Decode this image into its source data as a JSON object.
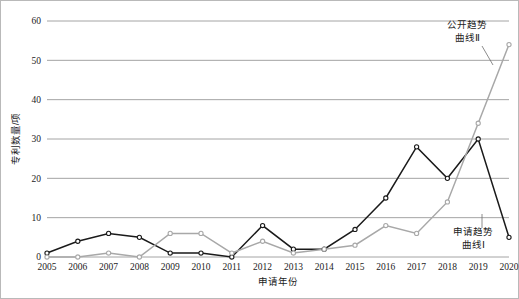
{
  "chart_data": {
    "type": "line",
    "title": "",
    "xlabel": "申请年份",
    "ylabel": "专利数量/项",
    "categories": [
      "2005",
      "2006",
      "2007",
      "2008",
      "2009",
      "2010",
      "2011",
      "2012",
      "2013",
      "2014",
      "2015",
      "2016",
      "2017",
      "2018",
      "2019",
      "2020"
    ],
    "ylim": [
      0,
      60
    ],
    "yticks": [
      "0",
      "10",
      "20",
      "30",
      "40",
      "50",
      "60"
    ],
    "grid": "horizontal",
    "legend_position": "inline-annotations",
    "series": [
      {
        "name": "申请趋势曲线Ⅰ",
        "color": "#1a1a1a",
        "marker": "open-circle",
        "values": [
          1,
          4,
          6,
          5,
          1,
          1,
          0,
          8,
          2,
          2,
          7,
          15,
          28,
          20,
          30,
          5
        ]
      },
      {
        "name": "公开趋势曲线Ⅱ",
        "color": "#a8a8a8",
        "marker": "open-circle",
        "values": [
          0,
          0,
          1,
          0,
          6,
          6,
          1,
          4,
          1,
          2,
          3,
          8,
          6,
          14,
          34,
          54
        ]
      }
    ],
    "annotations": [
      {
        "id": "annotation-series-2",
        "line1": "公开趋势",
        "line2": "曲线Ⅱ"
      },
      {
        "id": "annotation-series-1",
        "line1": "申请趋势",
        "line2": "曲线Ⅰ"
      }
    ]
  }
}
